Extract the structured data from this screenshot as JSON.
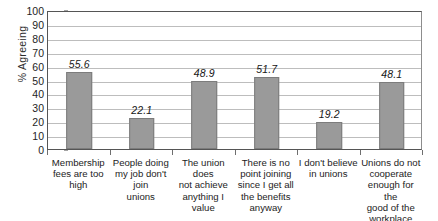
{
  "chart_data": {
    "type": "bar",
    "title": "",
    "xlabel": "",
    "ylabel": "% Agreeing",
    "ylim": [
      0,
      100
    ],
    "yticks": [
      100,
      90,
      80,
      70,
      60,
      50,
      40,
      30,
      20,
      10,
      0
    ],
    "grid": true,
    "legend": "none",
    "orientation": "vertical",
    "bar_color": "#9a9a9a",
    "bar_edge_color": "#7c7c7c",
    "categories": [
      "Membership fees are too high",
      "People doing my job don't join unions",
      "The union does not achieve anything I value",
      "There is no point joining since I get all the benefits anyway",
      "I don't believe in unions",
      "Unions do not cooperate enough for the good of the workplace"
    ],
    "values": [
      55.6,
      22.1,
      48.9,
      51.7,
      19.2,
      48.1
    ],
    "value_labels": [
      "55.6",
      "22.1",
      "48.9",
      "51.7",
      "19.2",
      "48.1"
    ]
  },
  "axis": {
    "y_title": "% Agreeing",
    "tick_labels": [
      "100",
      "90",
      "80",
      "70",
      "60",
      "50",
      "40",
      "30",
      "20",
      "10",
      "0"
    ]
  },
  "category_label_lines": [
    [
      "Membership",
      "fees are too",
      "high"
    ],
    [
      "People doing",
      "my job don't join",
      "unions"
    ],
    [
      "The union does",
      "not achieve",
      "anything I value"
    ],
    [
      "There is no",
      "point joining",
      "since I get all",
      "the benefits",
      "anyway"
    ],
    [
      "I don't believe",
      "in unions"
    ],
    [
      "Unions do not",
      "cooperate",
      "enough for the",
      "good of the",
      "workplace"
    ]
  ]
}
